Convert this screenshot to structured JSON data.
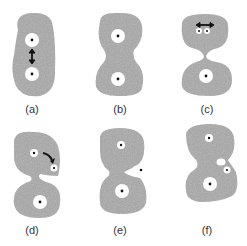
{
  "figure": {
    "panels": [
      {
        "id": "a",
        "label": "(a)"
      },
      {
        "id": "b",
        "label": "(b)"
      },
      {
        "id": "c",
        "label": "(c)"
      },
      {
        "id": "d",
        "label": "(d)"
      },
      {
        "id": "e",
        "label": "(e)"
      },
      {
        "id": "f",
        "label": "(f)"
      }
    ],
    "colors": {
      "body": "#a8a8a8",
      "nucleus": "#ffffff",
      "dot": "#111111",
      "arrow": "#111111"
    }
  }
}
